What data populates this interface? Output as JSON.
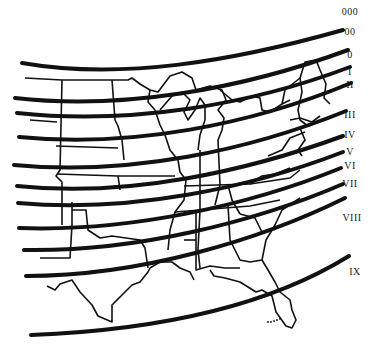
{
  "map": {
    "subject": "United States outline with curved zone bands",
    "ink_color": "#111111",
    "background": "#ffffff"
  },
  "zone_labels": [
    {
      "text": "000",
      "x": 350,
      "y": 12
    },
    {
      "text": "00",
      "x": 350,
      "y": 32
    },
    {
      "text": "0",
      "x": 350,
      "y": 55
    },
    {
      "text": "I",
      "x": 350,
      "y": 72
    },
    {
      "text": "II",
      "x": 350,
      "y": 85
    },
    {
      "text": "III",
      "x": 350,
      "y": 115
    },
    {
      "text": "IV",
      "x": 350,
      "y": 135
    },
    {
      "text": "V",
      "x": 350,
      "y": 152
    },
    {
      "text": "VI",
      "x": 350,
      "y": 166
    },
    {
      "text": "VII",
      "x": 350,
      "y": 184
    },
    {
      "text": "VIII",
      "x": 352,
      "y": 218
    },
    {
      "text": "IX",
      "x": 355,
      "y": 272
    }
  ],
  "zone_lines": [
    {
      "id": 1,
      "d": "M22,63 C120,80 230,62 343,30"
    },
    {
      "id": 2,
      "d": "M15,98 C120,110 240,90 348,50"
    },
    {
      "id": 3,
      "d": "M17,113 C130,125 250,105 350,67"
    },
    {
      "id": 4,
      "d": "M19,137 C130,148 250,125 351,83"
    },
    {
      "id": 5,
      "d": "M14,165 C130,176 250,150 346,111"
    },
    {
      "id": 6,
      "d": "M17,186 C130,198 250,170 343,136"
    },
    {
      "id": 7,
      "d": "M18,203 C130,213 250,188 343,152"
    },
    {
      "id": 8,
      "d": "M19,228 C130,232 250,205 341,168"
    },
    {
      "id": 9,
      "d": "M24,250 C135,252 255,222 343,184"
    },
    {
      "id": 10,
      "d": "M26,276 C140,276 260,240 345,198"
    },
    {
      "id": 11,
      "d": "M31,335 C160,330 270,305 349,256"
    }
  ]
}
